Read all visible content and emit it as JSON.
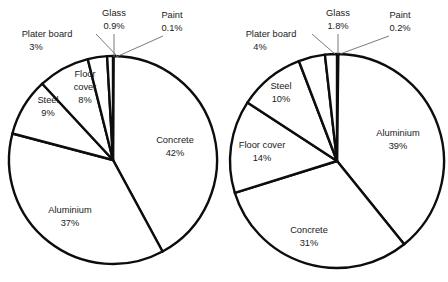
{
  "figure": {
    "title": "",
    "background": "#ffffff",
    "stroke_color": "#0d0d0d",
    "leader_color": "#6b6b6b",
    "text_color": "#1a1a1a"
  },
  "chart_data": [
    {
      "type": "pie",
      "title": "",
      "id": "left-pie",
      "center": [
        113,
        160
      ],
      "radius": 104,
      "start_angle_deg": 0,
      "direction": "clockwise",
      "grid": false,
      "legend": "none",
      "labels_inside": true,
      "categories": [
        "Paint",
        "Concrete",
        "Aluminium",
        "Steel",
        "Floor cover",
        "Plater board",
        "Glass"
      ],
      "values": [
        0.1,
        42,
        37,
        9,
        8,
        3,
        0.9
      ],
      "value_labels": [
        "0.1%",
        "42%",
        "37%",
        "9%",
        "8%",
        "3%",
        "0.9%"
      ],
      "slices": [
        {
          "name": "Paint",
          "value": 0.1,
          "label": "Paint",
          "value_label": "0.1%",
          "placement": "outside",
          "label_x": 172,
          "label_y": 16,
          "value_x": 172,
          "value_y": 29,
          "leader": [
            163,
            36,
            116,
            57
          ]
        },
        {
          "name": "Concrete",
          "value": 42,
          "label": "Concrete",
          "value_label": "42%",
          "placement": "inside",
          "label_x": 175,
          "label_y": 141,
          "value_x": 175,
          "value_y": 154
        },
        {
          "name": "Aluminium",
          "value": 37,
          "label": "Aluminium",
          "value_label": "37%",
          "placement": "inside",
          "label_x": 70,
          "label_y": 211,
          "value_x": 70,
          "value_y": 224
        },
        {
          "name": "Steel",
          "value": 9,
          "label": "Steel",
          "value_label": "9%",
          "placement": "inside",
          "label_x": 48,
          "label_y": 101,
          "value_x": 48,
          "value_y": 114
        },
        {
          "name": "Floor cover",
          "value": 8,
          "label": "Floor",
          "label2": "cover",
          "value_label": "8%",
          "placement": "inside",
          "label_x": 85,
          "label_y": 75,
          "label2_y": 88,
          "value_x": 85,
          "value_y": 101
        },
        {
          "name": "Plater board",
          "value": 3,
          "label": "Plater board",
          "value_label": "3%",
          "placement": "outside",
          "label_x": 47,
          "label_y": 35,
          "value_x": 36,
          "value_y": 48,
          "leader": [
            96,
            34,
            118,
            57
          ]
        },
        {
          "name": "Glass",
          "value": 0.9,
          "label": "Glass",
          "value_label": "0.9%",
          "placement": "outside",
          "label_x": 114,
          "label_y": 14,
          "value_x": 114,
          "value_y": 27,
          "leader": [
            114,
            34,
            114,
            57
          ]
        }
      ]
    },
    {
      "type": "pie",
      "title": "",
      "id": "right-pie",
      "center": [
        337,
        161
      ],
      "radius": 107,
      "start_angle_deg": 0,
      "direction": "clockwise",
      "grid": false,
      "legend": "none",
      "labels_inside": true,
      "categories": [
        "Paint",
        "Aluminium",
        "Concrete",
        "Floor cover",
        "Steel",
        "Plater board",
        "Glass"
      ],
      "values": [
        0.2,
        39,
        31,
        14,
        10,
        4,
        1.8
      ],
      "value_labels": [
        "0.2%",
        "39%",
        "31%",
        "14%",
        "10%",
        "4%",
        "1.8%"
      ],
      "slices": [
        {
          "name": "Paint",
          "value": 0.2,
          "label": "Paint",
          "value_label": "0.2%",
          "placement": "outside",
          "label_x": 400,
          "label_y": 16,
          "value_x": 400,
          "value_y": 29,
          "leader": [
            389,
            36,
            340,
            54
          ]
        },
        {
          "name": "Aluminium",
          "value": 39,
          "label": "Aluminium",
          "value_label": "39%",
          "placement": "inside",
          "label_x": 398,
          "label_y": 134,
          "value_x": 398,
          "value_y": 147
        },
        {
          "name": "Concrete",
          "value": 31,
          "label": "Concrete",
          "value_label": "31%",
          "placement": "inside",
          "label_x": 309,
          "label_y": 231,
          "value_x": 309,
          "value_y": 244
        },
        {
          "name": "Floor cover",
          "value": 14,
          "label": "Floor cover",
          "value_label": "14%",
          "placement": "inside",
          "label_x": 262,
          "label_y": 146,
          "value_x": 262,
          "value_y": 159
        },
        {
          "name": "Steel",
          "value": 10,
          "label": "Steel",
          "value_label": "10%",
          "placement": "inside",
          "label_x": 281,
          "label_y": 87,
          "value_x": 281,
          "value_y": 100
        },
        {
          "name": "Plater board",
          "value": 4,
          "label": "Plater board",
          "value_label": "4%",
          "placement": "outside",
          "label_x": 271,
          "label_y": 35,
          "value_x": 260,
          "value_y": 48,
          "leader": [
            312,
            34,
            335,
            54
          ]
        },
        {
          "name": "Glass",
          "value": 1.8,
          "label": "Glass",
          "value_label": "1.8%",
          "placement": "outside",
          "label_x": 338,
          "label_y": 14,
          "value_x": 338,
          "value_y": 27,
          "leader": [
            338,
            34,
            338,
            54
          ]
        }
      ]
    }
  ]
}
